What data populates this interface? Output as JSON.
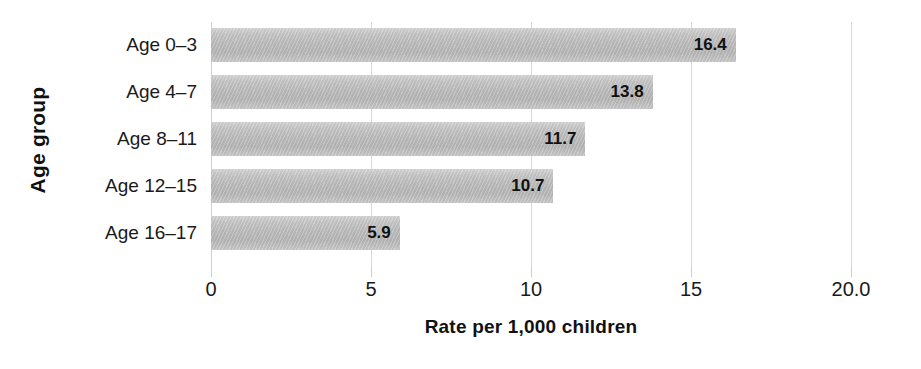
{
  "chart_data": {
    "type": "bar",
    "orientation": "horizontal",
    "title": "",
    "xlabel": "Rate per 1,000 children",
    "ylabel": "Age group",
    "categories": [
      "Age 0–3",
      "Age 4–7",
      "Age 8–11",
      "Age 12–15",
      "Age 16–17"
    ],
    "values": [
      16.4,
      13.8,
      11.7,
      10.7,
      5.9
    ],
    "value_labels": [
      "16.4",
      "13.8",
      "11.7",
      "10.7",
      "5.9"
    ],
    "xlim": [
      0,
      20
    ],
    "xticks": [
      0,
      5,
      10,
      15,
      20
    ],
    "xtick_labels": [
      "0",
      "5",
      "10",
      "15",
      "20.0"
    ],
    "grid": "vertical",
    "legend": "none",
    "bar_color": "#bfbfbf",
    "text_color": "#111111",
    "gridline_color": "#d8d8d8",
    "background_color": "#ffffff"
  }
}
